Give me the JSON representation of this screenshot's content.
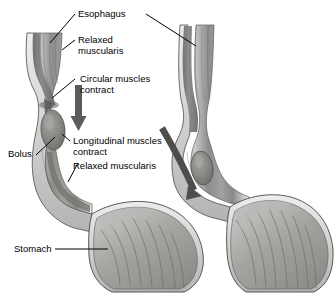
{
  "figure": {
    "type": "anatomical-illustration",
    "style": "grayscale-halftone",
    "background_color": "#ffffff",
    "panels": [
      {
        "name": "left-panel",
        "description": "Esophagus with bolus, circular muscles contracting above bolus, longitudinal muscles contracting, relaxed muscularis below, opening into stomach"
      },
      {
        "name": "right-panel",
        "description": "Esophagus with bolus advanced toward the lower esophageal sphincter entering the stomach"
      }
    ]
  },
  "labels": {
    "esophagus": "Esophagus",
    "relaxed_muscularis_top_line1": "Relaxed",
    "relaxed_muscularis_top_line2": "muscularis",
    "circular_line1": "Circular muscles",
    "circular_line2": "contract",
    "longitudinal_line1": "Longitudinal muscles",
    "longitudinal_line2": "contract",
    "relaxed_muscularis_lower": "Relaxed muscularis",
    "bolus": "Bolus",
    "stomach": "Stomach"
  },
  "arrows": {
    "left_downward": "downward-arrow",
    "right_curved": "curved-downward-arrow"
  },
  "colors": {
    "ink": "#000000",
    "tissue_light": "#d8d6d4",
    "tissue_mid": "#a9a7a6",
    "tissue_dark": "#7e7c7b",
    "lumen": "#8d8b8a",
    "outline": "#3a3a3a"
  }
}
